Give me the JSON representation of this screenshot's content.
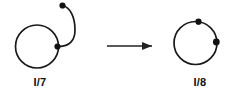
{
  "figure": {
    "background_color": "#ffffff",
    "stroke_color": "#1a1a1a",
    "dot_color": "#111111",
    "width": 237,
    "height": 106,
    "left_panel": {
      "label": "I/7",
      "label_x": 40,
      "label_y": 86,
      "circle": {
        "cx": 37,
        "cy": 46.5,
        "r": 21.5
      },
      "dots": [
        {
          "name": "junction-dot",
          "cx": 57.5,
          "cy": 46.5,
          "r": 3.1
        },
        {
          "name": "free-end-dot",
          "cx": 62.5,
          "cy": 5.5,
          "r": 3.1
        }
      ],
      "tail_path": "M 57.5 46.5 C 70 47 75 40 75 30 C 75 17 70 7 62.5 5.5"
    },
    "arrow": {
      "name": "transform-arrow",
      "x1": 107,
      "x2": 152,
      "y": 46,
      "head_points": "152,46 142,42 142,50"
    },
    "right_panel": {
      "label": "I/8",
      "label_x": 200,
      "label_y": 86,
      "circle": {
        "cx": 195.5,
        "cy": 43,
        "r": 21.5
      },
      "dots": [
        {
          "name": "top-dot",
          "cx": 198.5,
          "cy": 21.7,
          "r": 3.1
        },
        {
          "name": "right-dot",
          "cx": 216.3,
          "cy": 42.0,
          "r": 3.4
        }
      ]
    }
  }
}
